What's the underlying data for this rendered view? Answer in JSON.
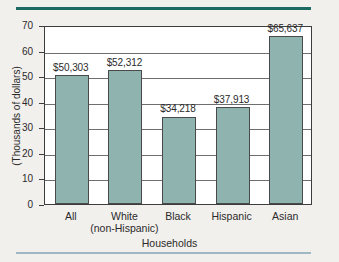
{
  "chart_data": {
    "type": "bar",
    "title": "",
    "xlabel": "Households",
    "ylabel": "(Thousands of dollars)",
    "categories": [
      "All",
      "White (non-Hispanic)",
      "Black",
      "Hispanic",
      "Asian"
    ],
    "category_lines": [
      {
        "line1": "All",
        "line2": ""
      },
      {
        "line1": "White",
        "line2": "(non-Hispanic)"
      },
      {
        "line1": "Black",
        "line2": ""
      },
      {
        "line1": "Hispanic",
        "line2": ""
      },
      {
        "line1": "Asian",
        "line2": ""
      }
    ],
    "values": [
      50.303,
      52.312,
      34.218,
      37.913,
      65.637
    ],
    "data_labels": [
      "$50,303",
      "$52,312",
      "$34,218",
      "$37,913",
      "$65,637"
    ],
    "ylim": [
      0,
      70
    ],
    "yticks": [
      0,
      10,
      20,
      30,
      40,
      50,
      60,
      70
    ],
    "ytick_labels": [
      "0",
      "10",
      "20",
      "30",
      "40",
      "50",
      "60",
      "70"
    ],
    "grid": true,
    "legend": "none",
    "bar_color": "#8fb3ae",
    "rule_top_color": "#1d6a62",
    "rule_bottom_color": "#9fb9c4"
  }
}
